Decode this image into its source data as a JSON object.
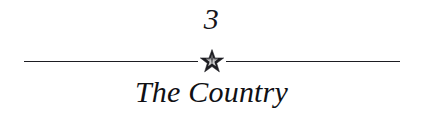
{
  "page": {
    "background_color": "#ffffff",
    "text_color": "#111111"
  },
  "chapter": {
    "number": "3",
    "title": "The Country",
    "ornament": {
      "icon": "star-icon",
      "points": 5,
      "color": "#1d1d22",
      "rule_color": "#1d1d22",
      "rule_left_label": "",
      "rule_right_label": ""
    }
  }
}
